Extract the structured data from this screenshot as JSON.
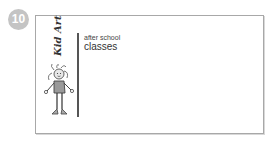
{
  "badge": {
    "number": "10",
    "color": "#c4c4c4"
  },
  "card": {
    "brand": "Kid Art",
    "subtitle": "after school",
    "title": "classes",
    "illustration": "child-drawing-figure"
  }
}
